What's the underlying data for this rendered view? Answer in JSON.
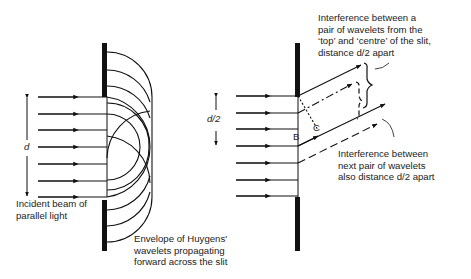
{
  "left_diagram": {
    "dimension_label": "d",
    "caption_incident": "Incident beam of\nparallel light",
    "caption_envelope": "Envelope of Huygens'\nwavelets propagating\nforward across the slit",
    "ray_count": 7
  },
  "right_diagram": {
    "dimension_label": "d/2",
    "point_b": "B",
    "point_c": "C",
    "caption_top_pair": "Interference between a\npair of wavelets from the\n‘top’ and ‘centre’ of the slit,\ndistance d/2 apart",
    "caption_next_pair": "Interference between\nnext pair of wavelets\nalso distance d/2 apart",
    "ray_count": 7
  },
  "colors": {
    "line": "#111111",
    "text": "#222222",
    "background": "#ffffff"
  }
}
